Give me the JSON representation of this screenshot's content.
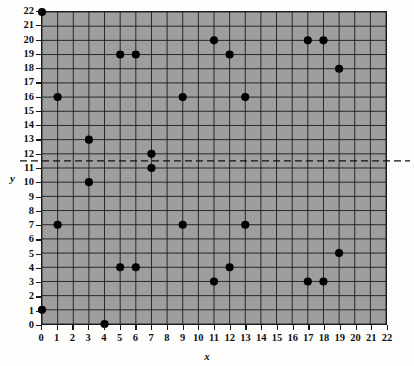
{
  "chart_data": {
    "type": "scatter",
    "title": "",
    "xlabel": "x",
    "ylabel": "y",
    "xlim": [
      0,
      22
    ],
    "ylim": [
      0,
      22
    ],
    "grid": true,
    "legend": "none",
    "x_ticks": [
      0,
      1,
      2,
      3,
      4,
      5,
      6,
      7,
      8,
      9,
      10,
      11,
      12,
      13,
      14,
      15,
      16,
      17,
      18,
      19,
      20,
      21,
      22
    ],
    "y_ticks": [
      0,
      1,
      2,
      3,
      4,
      5,
      6,
      7,
      8,
      9,
      10,
      11,
      12,
      13,
      14,
      15,
      16,
      17,
      18,
      19,
      20,
      21,
      22
    ],
    "points": [
      {
        "x": 0,
        "y": 22
      },
      {
        "x": 0,
        "y": 1
      },
      {
        "x": 1,
        "y": 16
      },
      {
        "x": 1,
        "y": 7
      },
      {
        "x": 3,
        "y": 13
      },
      {
        "x": 3,
        "y": 10
      },
      {
        "x": 4,
        "y": 0
      },
      {
        "x": 5,
        "y": 19
      },
      {
        "x": 5,
        "y": 4
      },
      {
        "x": 6,
        "y": 19
      },
      {
        "x": 6,
        "y": 4
      },
      {
        "x": 7,
        "y": 12
      },
      {
        "x": 7,
        "y": 11
      },
      {
        "x": 9,
        "y": 16
      },
      {
        "x": 9,
        "y": 7
      },
      {
        "x": 11,
        "y": 20
      },
      {
        "x": 11,
        "y": 3
      },
      {
        "x": 12,
        "y": 19
      },
      {
        "x": 12,
        "y": 4
      },
      {
        "x": 13,
        "y": 16
      },
      {
        "x": 13,
        "y": 7
      },
      {
        "x": 17,
        "y": 20
      },
      {
        "x": 17,
        "y": 3
      },
      {
        "x": 18,
        "y": 20
      },
      {
        "x": 18,
        "y": 3
      },
      {
        "x": 19,
        "y": 18
      },
      {
        "x": 19,
        "y": 5
      }
    ],
    "reference_line": {
      "orientation": "horizontal",
      "value": 11.5,
      "style": "dashed",
      "extends_beyond_axes": true
    },
    "colors": {
      "plot_background": "#9e9e9e",
      "grid_line": "#1a1a1a",
      "point_fill": "#000000",
      "axis": "#1a1a1a",
      "page_background": "#fdfdfc"
    }
  }
}
